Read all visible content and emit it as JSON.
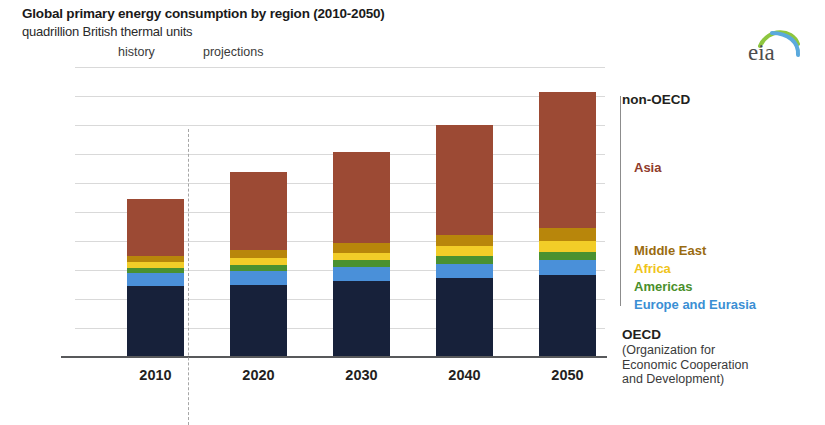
{
  "header": {
    "title": "Global primary energy consumption by region (2010-2050)",
    "subtitle": "quadrillion British thermal units",
    "logo_name": "eia"
  },
  "annotations": {
    "history": "history",
    "projections": "projections"
  },
  "legend": {
    "non_oecd": "non-OECD",
    "oecd": "OECD",
    "oecd_sub_line1": "(Organization for",
    "oecd_sub_line2": "Economic Cooperation",
    "oecd_sub_line3": "and Development)",
    "items": [
      {
        "label": "Asia",
        "color": "#8f3b2b"
      },
      {
        "label": "Middle East",
        "color": "#9a6b10"
      },
      {
        "label": "Africa",
        "color": "#f0c419"
      },
      {
        "label": "Americas",
        "color": "#4a8f2c"
      },
      {
        "label": "Europe and Eurasia",
        "color": "#3b8fd4"
      }
    ]
  },
  "chart_data": {
    "type": "bar",
    "stacked": true,
    "title": "Global primary energy consumption by region (2010-2050)",
    "subtitle": "quadrillion British thermal units",
    "xlabel": "",
    "ylabel": "quadrillion British thermal units",
    "ylim": [
      0,
      1000
    ],
    "yticks": [
      0,
      100,
      200,
      300,
      400,
      500,
      600,
      700,
      800,
      900,
      1000
    ],
    "ytick_labels": [
      "0",
      "100",
      "200",
      "300",
      "400",
      "500",
      "600",
      "700",
      "800",
      "900",
      "1,000"
    ],
    "grid": true,
    "legend_position": "right",
    "categories": [
      "2010",
      "2020",
      "2030",
      "2040",
      "2050"
    ],
    "history_categories": [
      "2010"
    ],
    "projection_categories": [
      "2020",
      "2030",
      "2040",
      "2050"
    ],
    "series": [
      {
        "name": "OECD",
        "color": "#17213a",
        "values": [
          240,
          245,
          258,
          268,
          278
        ]
      },
      {
        "name": "Europe and Eurasia",
        "color": "#4a90d9",
        "values": [
          45,
          47,
          48,
          50,
          52
        ]
      },
      {
        "name": "Americas",
        "color": "#4a9130",
        "values": [
          20,
          23,
          25,
          28,
          30
        ]
      },
      {
        "name": "Africa",
        "color": "#f2cd28",
        "values": [
          18,
          22,
          26,
          32,
          38
        ]
      },
      {
        "name": "Middle East",
        "color": "#b8860b",
        "values": [
          22,
          28,
          33,
          38,
          44
        ]
      },
      {
        "name": "Asia",
        "color": "#9c4a34",
        "values": [
          195,
          270,
          315,
          382,
          470
        ]
      }
    ],
    "totals": [
      540,
      635,
      705,
      798,
      912
    ],
    "stack_order_bottom_to_top": [
      "OECD",
      "Europe and Eurasia",
      "Americas",
      "Africa",
      "Middle East",
      "Asia"
    ],
    "group_brackets": [
      {
        "label": "OECD",
        "series": [
          "OECD"
        ]
      },
      {
        "label": "non-OECD",
        "series": [
          "Europe and Eurasia",
          "Americas",
          "Africa",
          "Middle East",
          "Asia"
        ]
      }
    ]
  }
}
